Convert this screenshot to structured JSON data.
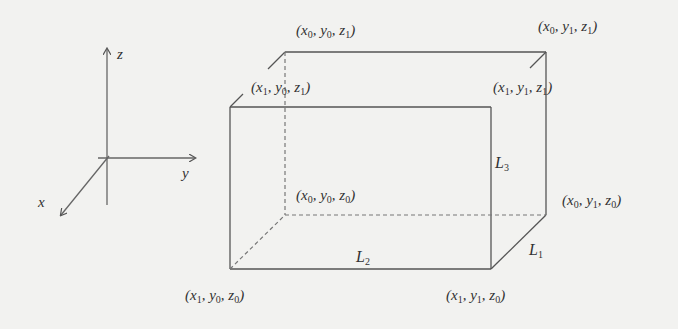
{
  "figure": {
    "axes": {
      "x_label": "x",
      "y_label": "y",
      "z_label": "z"
    },
    "box": {
      "vertices": [
        {
          "id": "v_x0y0z1",
          "label": "(x0, y0, z1)",
          "parts": [
            "x",
            "0",
            "y",
            "0",
            "z",
            "1"
          ]
        },
        {
          "id": "v_x0y1z1",
          "label": "(x0, y1, z1)",
          "parts": [
            "x",
            "0",
            "y",
            "1",
            "z",
            "1"
          ]
        },
        {
          "id": "v_x1y0z1",
          "label": "(x1, y0, z1)",
          "parts": [
            "x",
            "1",
            "y",
            "0",
            "z",
            "1"
          ]
        },
        {
          "id": "v_x1y1z1",
          "label": "(x1, y1, z1)",
          "parts": [
            "x",
            "1",
            "y",
            "1",
            "z",
            "1"
          ]
        },
        {
          "id": "v_x0y0z0",
          "label": "(x0, y0, z0)",
          "parts": [
            "x",
            "0",
            "y",
            "0",
            "z",
            "0"
          ]
        },
        {
          "id": "v_x0y1z0",
          "label": "(x0, y1, z0)",
          "parts": [
            "x",
            "0",
            "y",
            "1",
            "z",
            "0"
          ]
        },
        {
          "id": "v_x1y0z0",
          "label": "(x1, y0, z0)",
          "parts": [
            "x",
            "1",
            "y",
            "0",
            "z",
            "0"
          ]
        },
        {
          "id": "v_x1y1z0",
          "label": "(x1, y1, z0)",
          "parts": [
            "x",
            "1",
            "y",
            "1",
            "z",
            "0"
          ]
        }
      ],
      "edge_labels": {
        "L1": {
          "letter": "L",
          "sub": "1"
        },
        "L2": {
          "letter": "L",
          "sub": "2"
        },
        "L3": {
          "letter": "L",
          "sub": "3"
        }
      }
    },
    "colors": {
      "background": "#f2f2f0",
      "line": "#555555",
      "text": "#333333"
    }
  }
}
